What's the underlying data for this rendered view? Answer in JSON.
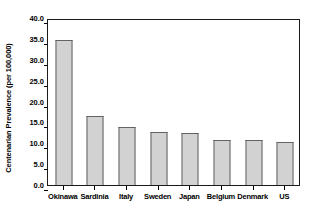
{
  "chart_data": {
    "type": "bar",
    "title": "",
    "subtitle": "",
    "xlabel": "",
    "ylabel": "Centenarian Prevalence (per 100,000)",
    "categories": [
      "Okinawa",
      "Sardinia",
      "Italy",
      "Sweden",
      "Japan",
      "Belgium",
      "Denmark",
      "US"
    ],
    "values": [
      34.7,
      16.5,
      13.9,
      12.7,
      12.4,
      10.8,
      10.7,
      10.2
    ],
    "ylim": [
      0.0,
      40.0
    ],
    "ytick_values": [
      0.0,
      5.0,
      10.0,
      15.0,
      20.0,
      25.0,
      30.0,
      35.0,
      40.0
    ],
    "ytick_labels": [
      "0.0",
      "5.0",
      "10.0",
      "15.0",
      "20.0",
      "25.0",
      "30.0",
      "35.0",
      "40.0"
    ],
    "grid": false,
    "legend": false,
    "legend_position": "none",
    "bar_fill_color": "#d2d2d2",
    "bar_border_color": "#636363",
    "frame_color": "#1a1a1a",
    "text_color": "#000000",
    "background_color": "#ffffff"
  }
}
